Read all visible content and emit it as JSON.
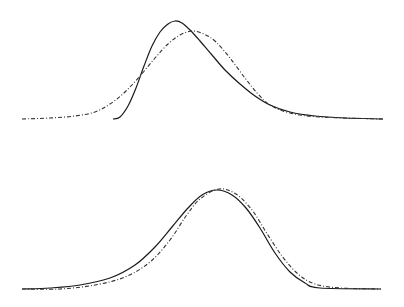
{
  "chart_data": [
    {
      "type": "line",
      "title": "",
      "xlabel": "",
      "ylabel": "",
      "grid": false,
      "legend": null,
      "series": [
        {
          "name": "solid",
          "style": "solid",
          "description": "right-skewed density starting abruptly near x=113px, peak near x=175px",
          "points": [
            [
              113,
              119
            ],
            [
              120,
              117
            ],
            [
              128,
              106
            ],
            [
              136,
              88
            ],
            [
              144,
              66
            ],
            [
              152,
              46
            ],
            [
              160,
              32
            ],
            [
              168,
              24
            ],
            [
              175,
              21
            ],
            [
              182,
              23
            ],
            [
              190,
              30
            ],
            [
              200,
              41
            ],
            [
              212,
              55
            ],
            [
              225,
              70
            ],
            [
              240,
              84
            ],
            [
              255,
              96
            ],
            [
              270,
              105
            ],
            [
              290,
              112
            ],
            [
              315,
              116
            ],
            [
              345,
              118
            ],
            [
              383,
              119
            ]
          ]
        },
        {
          "name": "dash-dot",
          "style": "dashdot",
          "description": "smooth symmetric-ish density, peak near x=192px",
          "points": [
            [
              22,
              119
            ],
            [
              50,
              118
            ],
            [
              75,
              116
            ],
            [
              95,
              112
            ],
            [
              110,
              104
            ],
            [
              125,
              92
            ],
            [
              140,
              76
            ],
            [
              155,
              58
            ],
            [
              168,
              44
            ],
            [
              180,
              35
            ],
            [
              192,
              31
            ],
            [
              204,
              34
            ],
            [
              216,
              42
            ],
            [
              230,
              58
            ],
            [
              245,
              78
            ],
            [
              258,
              94
            ],
            [
              270,
              105
            ],
            [
              290,
              113
            ],
            [
              320,
              117
            ],
            [
              383,
              119
            ]
          ]
        }
      ]
    },
    {
      "type": "line",
      "title": "",
      "xlabel": "",
      "ylabel": "",
      "grid": false,
      "legend": null,
      "series": [
        {
          "name": "solid",
          "style": "solid",
          "description": "near-normal density, peak near x=217px",
          "points": [
            [
              22,
              289
            ],
            [
              50,
              288
            ],
            [
              80,
              285
            ],
            [
              110,
              278
            ],
            [
              135,
              265
            ],
            [
              155,
              247
            ],
            [
              172,
              227
            ],
            [
              188,
              208
            ],
            [
              202,
              195
            ],
            [
              217,
              190
            ],
            [
              232,
              195
            ],
            [
              246,
              208
            ],
            [
              260,
              228
            ],
            [
              275,
              253
            ],
            [
              290,
              272
            ],
            [
              305,
              283
            ],
            [
              320,
              288
            ],
            [
              381,
              289
            ]
          ]
        },
        {
          "name": "dash-dot",
          "style": "dashdot",
          "description": "near-normal density, slightly narrower left tail, peak near x=219px",
          "points": [
            [
              22,
              289
            ],
            [
              60,
              289
            ],
            [
              95,
              285
            ],
            [
              125,
              277
            ],
            [
              150,
              262
            ],
            [
              170,
              240
            ],
            [
              186,
              216
            ],
            [
              200,
              199
            ],
            [
              219,
              189
            ],
            [
              236,
              194
            ],
            [
              252,
              210
            ],
            [
              266,
              232
            ],
            [
              282,
              256
            ],
            [
              298,
              274
            ],
            [
              315,
              284
            ],
            [
              340,
              288
            ],
            [
              381,
              289
            ]
          ]
        }
      ]
    }
  ]
}
